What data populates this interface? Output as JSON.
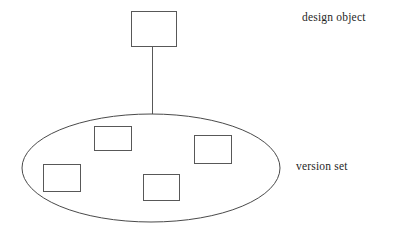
{
  "diagram": {
    "type": "concept-diagram",
    "canvas": {
      "width": 404,
      "height": 231,
      "background": "#ffffff"
    },
    "stroke_color": "#4a4a4a",
    "box_stroke_color": "#585858",
    "fill_color": "#ffffff",
    "labels": [
      {
        "id": "design-object",
        "text": "design object",
        "x": 302,
        "y": 11
      },
      {
        "id": "version-set",
        "text": "version set",
        "x": 296,
        "y": 160
      }
    ],
    "nodes": {
      "design_object_box": {
        "x": 131,
        "y": 11,
        "width": 45,
        "height": 35
      },
      "version_set_ellipse": {
        "cx": 151,
        "cy": 168,
        "rx": 129,
        "ry": 54
      },
      "version_boxes": [
        {
          "id": "version-box-1",
          "x": 94,
          "y": 126,
          "width": 37,
          "height": 24
        },
        {
          "id": "version-box-2",
          "x": 194,
          "y": 135,
          "width": 37,
          "height": 28
        },
        {
          "id": "version-box-3",
          "x": 43,
          "y": 164,
          "width": 37,
          "height": 27
        },
        {
          "id": "version-box-4",
          "x": 143,
          "y": 174,
          "width": 36,
          "height": 26
        }
      ]
    },
    "connector": {
      "x1": 152,
      "y1": 46,
      "x2": 152,
      "y2": 114
    }
  }
}
